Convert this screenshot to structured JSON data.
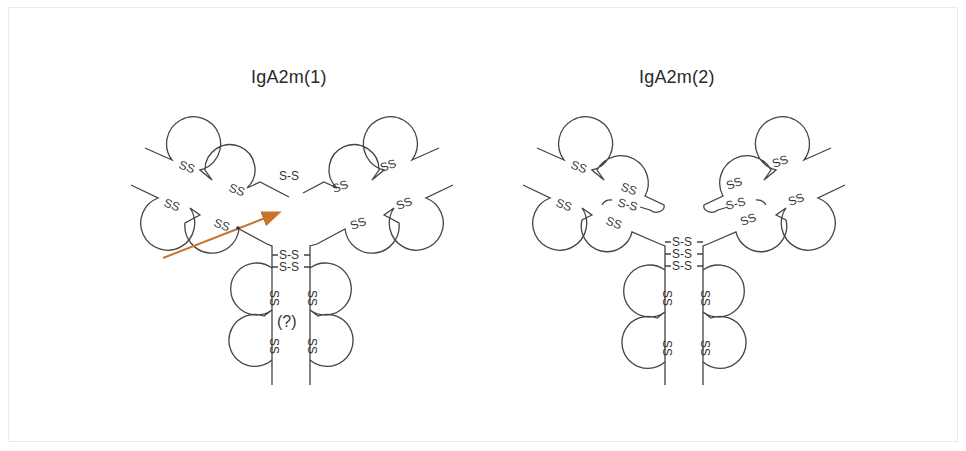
{
  "diagram": {
    "colors": {
      "line": "#444444",
      "arrow": "#c8742a",
      "frame": "#f3e9d6"
    },
    "panels": [
      {
        "title": "IgA2m(1)",
        "fab_labels": [
          "SS",
          "SS",
          "SS",
          "SS",
          "SS",
          "SS",
          "SS",
          "SS"
        ],
        "inter_chain_bond": "S-S",
        "hinge_bonds": [
          "S-S",
          "S-S"
        ],
        "fc_labels": [
          "SS",
          "SS",
          "SS",
          "SS"
        ],
        "unknown_marker": "(?)",
        "arrow": true
      },
      {
        "title": "IgA2m(2)",
        "fab_labels": [
          "SS",
          "SS",
          "SS",
          "SS",
          "SS",
          "SS",
          "SS",
          "SS"
        ],
        "light_heavy_bonds": [
          "S-S",
          "S-S"
        ],
        "hinge_bonds": [
          "S-S",
          "S-S",
          "S-S"
        ],
        "fc_labels": [
          "SS",
          "SS",
          "SS",
          "SS"
        ]
      }
    ]
  }
}
